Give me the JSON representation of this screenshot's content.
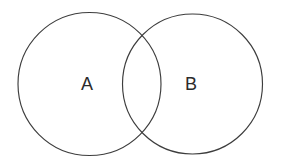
{
  "figure": {
    "kind": "venn-diagram",
    "background_color": "#ffffff",
    "stroke_color": "#3d3d3d",
    "label_color": "#2b2b2b",
    "width": 281,
    "height": 168
  },
  "diagram": {
    "sets": [
      {
        "id": "set-a",
        "label": "A",
        "cx": 89.5,
        "cy": 84,
        "r": 71.5,
        "label_x": 87,
        "label_y": 84
      },
      {
        "id": "set-b",
        "label": "B",
        "cx": 192.5,
        "cy": 84,
        "r": 70,
        "label_x": 191,
        "label_y": 84
      }
    ],
    "intersection": {
      "label": "",
      "upper_crossing_x": 141,
      "upper_crossing_y": 33,
      "lower_crossing_x": 141,
      "lower_crossing_y": 135
    }
  }
}
